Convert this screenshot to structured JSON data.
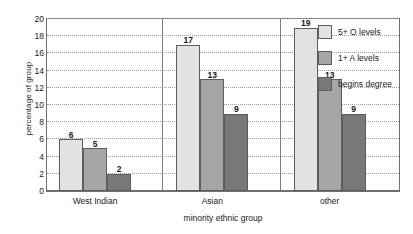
{
  "chart_data": {
    "type": "bar",
    "title": "",
    "xlabel": "minority ethnic group",
    "ylabel": "percentage of group",
    "categories": [
      "West Indian",
      "Asian",
      "other"
    ],
    "series": [
      {
        "name": "5+ O levels",
        "color": "#e2e2e2",
        "values": [
          6,
          17,
          19
        ]
      },
      {
        "name": "1+ A levels",
        "color": "#a6a6a6",
        "values": [
          5,
          13,
          13
        ]
      },
      {
        "name": "begins degree",
        "color": "#787878",
        "values": [
          2,
          9,
          9
        ]
      }
    ],
    "ylim": [
      0,
      20
    ],
    "yticks": [
      0,
      2,
      4,
      6,
      8,
      10,
      12,
      14,
      16,
      18,
      20
    ],
    "grid": true,
    "legend_position": "inside-top-right"
  }
}
